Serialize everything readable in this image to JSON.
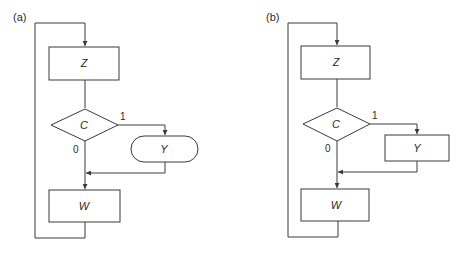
{
  "panels": [
    {
      "label": "(a)",
      "nodes": {
        "z": "Z",
        "c": "C",
        "y": "Y",
        "w": "W"
      },
      "y_shape": "terminator",
      "edges": {
        "true_label": "1",
        "false_label": "0"
      }
    },
    {
      "label": "(b)",
      "nodes": {
        "z": "Z",
        "c": "C",
        "y": "Y",
        "w": "W"
      },
      "y_shape": "rectangle",
      "edges": {
        "true_label": "1",
        "false_label": "0"
      }
    }
  ]
}
